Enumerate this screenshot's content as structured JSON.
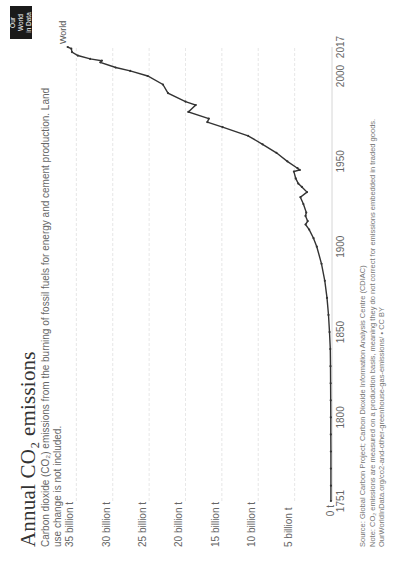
{
  "header": {
    "title": "Annual CO₂ emissions",
    "subtitle": "Carbon dioxide (CO₂) emissions from the burning of fossil fuels for energy and cement production. Land use change is not included.",
    "logo_line1": "Our World",
    "logo_line2": "in Data"
  },
  "footer": {
    "source": "Source: Global Carbon Project; Carbon Dioxide Information Analysis Centre (CDIAC)",
    "note": "Note: CO₂ emissions are measured on a production basis, meaning they do not correct for emissions embedded in traded goods.",
    "url": "OurWorldInData.org/co2-and-other-greenhouse-gas-emissions/ • CC BY"
  },
  "colors": {
    "line": "#333333",
    "grid": "#dddddd",
    "text": "#666666",
    "logo_bg": "#1a1a1a"
  },
  "chart_data": {
    "type": "line",
    "title": "Annual CO₂ emissions",
    "subtitle": "Carbon dioxide (CO₂) emissions from the burning of fossil fuels for energy and cement production. Land use change is not included.",
    "xlabel": "",
    "ylabel": "",
    "orientation_note": "image rotated 90° counter-clockwise",
    "xlim": [
      1751,
      2017
    ],
    "ylim": [
      0,
      35000000000
    ],
    "grid": true,
    "x_ticks": [
      "1751",
      "1800",
      "1850",
      "1900",
      "1950",
      "2000",
      "2017"
    ],
    "y_ticks": [
      "0 t",
      "5 billion t",
      "10 billion t",
      "15 billion t",
      "20 billion t",
      "25 billion t",
      "30 billion t",
      "35 billion t"
    ],
    "legend": [],
    "series": [
      {
        "name": "World",
        "unit": "billion t",
        "x": [
          1751,
          1760,
          1770,
          1780,
          1790,
          1800,
          1810,
          1820,
          1830,
          1840,
          1850,
          1860,
          1870,
          1880,
          1890,
          1900,
          1905,
          1910,
          1913,
          1915,
          1918,
          1920,
          1925,
          1929,
          1932,
          1935,
          1937,
          1940,
          1944,
          1945,
          1946,
          1950,
          1955,
          1960,
          1965,
          1970,
          1973,
          1975,
          1979,
          1983,
          1985,
          1990,
          1995,
          2000,
          2003,
          2005,
          2008,
          2009,
          2010,
          2012,
          2014,
          2016,
          2017
        ],
        "values": [
          0.01,
          0.01,
          0.02,
          0.02,
          0.03,
          0.03,
          0.04,
          0.05,
          0.07,
          0.1,
          0.2,
          0.35,
          0.55,
          0.85,
          1.3,
          1.95,
          2.4,
          3.0,
          3.5,
          3.2,
          3.5,
          3.4,
          3.8,
          4.2,
          3.3,
          4.0,
          4.5,
          4.85,
          5.1,
          4.3,
          4.6,
          6.0,
          7.5,
          9.4,
          11.4,
          14.9,
          17.0,
          16.8,
          19.6,
          18.6,
          20.0,
          22.4,
          23.1,
          25.2,
          27.6,
          29.6,
          31.7,
          31.5,
          33.1,
          34.8,
          35.6,
          35.7,
          36.2
        ]
      }
    ]
  },
  "plot": {
    "series_label": "World"
  }
}
